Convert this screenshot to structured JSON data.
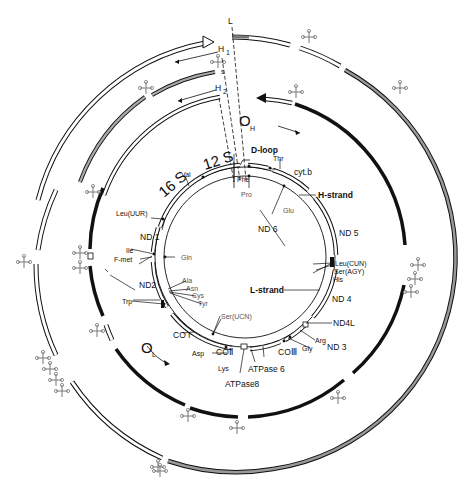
{
  "diagram": {
    "type": "circular mitochondrial genome map with transcription units",
    "center": [
      245,
      257
    ],
    "colors": {
      "line": "#111111",
      "gray_band": "#888888",
      "trna": "#777777",
      "background": "#ffffff"
    },
    "labels": {
      "L": "L",
      "H1": "H",
      "H1_sub": "1",
      "H2": "H",
      "H2_sub": "2",
      "OH": "O",
      "OH_sub": "H",
      "OL": "O",
      "OL_sub": "L",
      "d_loop": "D-loop",
      "h_strand": "H-strand",
      "l_strand": "L-strand",
      "s": "s"
    },
    "genes": {
      "rrna_12s": "12 S",
      "rrna_16s": "16 S",
      "cytb": "cyt.b",
      "nd6": "ND 6",
      "nd5": "ND 5",
      "nd4": "ND 4",
      "nd4l": "ND4L",
      "nd3": "ND 3",
      "co3": "COⅢ",
      "atpase6": "ATPase 6",
      "atpase8": "ATPase8",
      "co2": "COⅡ",
      "co1": "CO I",
      "nd2": "ND2",
      "nd1": "ND 1"
    },
    "trnas": {
      "phe": "Phe",
      "val": "Val",
      "thr": "Thr",
      "pro": "Pro",
      "glu": "Glu",
      "leu_cun": "Leu(CUN)",
      "ser_agy": "Ser(AGY)",
      "his": "His",
      "arg": "Arg",
      "gly": "Gly",
      "lys": "Lys",
      "asp": "Asp",
      "ser_ucn": "Ser(UCN)",
      "trp": "Trp",
      "ala": "Ala",
      "asn": "Asn",
      "cys": "Cys",
      "tyr": "Tyr",
      "gln": "Gln",
      "ile": "Ile",
      "fmet": "F-met",
      "leu_uur": "Leu(UUR)"
    }
  }
}
